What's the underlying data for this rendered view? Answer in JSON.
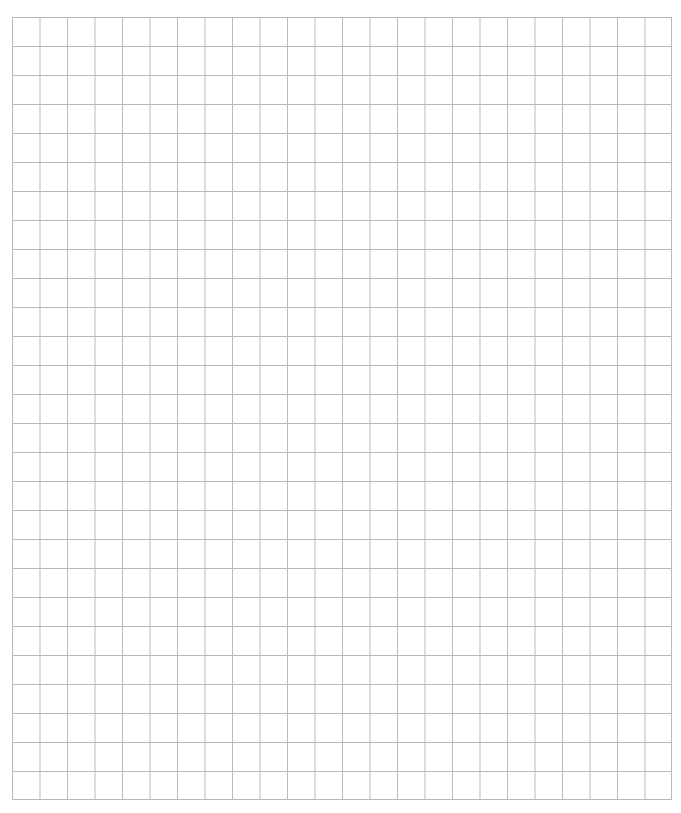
{
  "grid": {
    "columns": 24,
    "rows": 27,
    "line_color": "#b8b8b8",
    "background_color": "#ffffff"
  }
}
